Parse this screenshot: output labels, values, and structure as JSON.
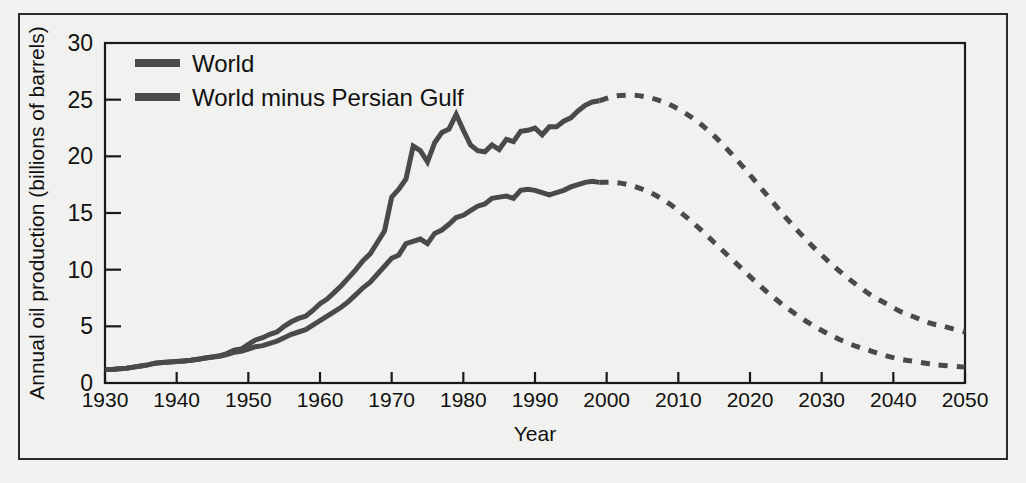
{
  "figure": {
    "background_color": "#f1f1ef",
    "frame_color": "#2b2b2b"
  },
  "chart_data": {
    "type": "line",
    "title": "",
    "subtitle": "",
    "xlabel": "Year",
    "ylabel": "Annual oil production (billions of barrels)",
    "xlim": [
      1930,
      2050
    ],
    "ylim": [
      0,
      30
    ],
    "xticks": [
      1930,
      1940,
      1950,
      1960,
      1970,
      1980,
      1990,
      2000,
      2010,
      2020,
      2030,
      2040,
      2050
    ],
    "yticks": [
      0,
      5,
      10,
      15,
      20,
      25,
      30
    ],
    "xtick_labels": [
      "1930",
      "1940",
      "1950",
      "1960",
      "1970",
      "1980",
      "1990",
      "2000",
      "2010",
      "2020",
      "2030",
      "2040",
      "2050"
    ],
    "ytick_labels": [
      "0",
      "5",
      "10",
      "15",
      "20",
      "25",
      "30"
    ],
    "grid": false,
    "legend_position": "upper-left",
    "line_color": "#4a4a4a",
    "line_width": 5,
    "projection_style": "dashed",
    "history_end_year": 1999,
    "series": [
      {
        "name": "World",
        "color": "#4a4a4a",
        "x": [
          1930,
          1931,
          1932,
          1933,
          1934,
          1935,
          1936,
          1937,
          1938,
          1939,
          1940,
          1941,
          1942,
          1943,
          1944,
          1945,
          1946,
          1947,
          1948,
          1949,
          1950,
          1951,
          1952,
          1953,
          1954,
          1955,
          1956,
          1957,
          1958,
          1959,
          1960,
          1961,
          1962,
          1963,
          1964,
          1965,
          1966,
          1967,
          1968,
          1969,
          1970,
          1971,
          1972,
          1973,
          1974,
          1975,
          1976,
          1977,
          1978,
          1979,
          1980,
          1981,
          1982,
          1983,
          1984,
          1985,
          1986,
          1987,
          1988,
          1989,
          1990,
          1991,
          1992,
          1993,
          1994,
          1995,
          1996,
          1997,
          1998,
          1999
        ],
        "values": [
          1.2,
          1.2,
          1.25,
          1.3,
          1.4,
          1.5,
          1.6,
          1.75,
          1.8,
          1.85,
          1.9,
          1.95,
          2.0,
          2.1,
          2.2,
          2.3,
          2.4,
          2.6,
          2.9,
          3.0,
          3.4,
          3.8,
          4.0,
          4.3,
          4.5,
          5.0,
          5.4,
          5.7,
          5.9,
          6.4,
          7.0,
          7.4,
          8.0,
          8.6,
          9.3,
          10.0,
          10.8,
          11.4,
          12.4,
          13.4,
          16.4,
          17.1,
          18.0,
          20.9,
          20.5,
          19.5,
          21.2,
          22.1,
          22.4,
          23.7,
          22.3,
          21.0,
          20.5,
          20.4,
          21.0,
          20.6,
          21.5,
          21.3,
          22.2,
          22.3,
          22.5,
          21.9,
          22.6,
          22.6,
          23.1,
          23.4,
          24.0,
          24.5,
          24.8,
          24.9
        ]
      },
      {
        "name": "World minus Persian Gulf",
        "color": "#4a4a4a",
        "x": [
          1930,
          1931,
          1932,
          1933,
          1934,
          1935,
          1936,
          1937,
          1938,
          1939,
          1940,
          1941,
          1942,
          1943,
          1944,
          1945,
          1946,
          1947,
          1948,
          1949,
          1950,
          1951,
          1952,
          1953,
          1954,
          1955,
          1956,
          1957,
          1958,
          1959,
          1960,
          1961,
          1962,
          1963,
          1964,
          1965,
          1966,
          1967,
          1968,
          1969,
          1970,
          1971,
          1972,
          1973,
          1974,
          1975,
          1976,
          1977,
          1978,
          1979,
          1980,
          1981,
          1982,
          1983,
          1984,
          1985,
          1986,
          1987,
          1988,
          1989,
          1990,
          1991,
          1992,
          1993,
          1994,
          1995,
          1996,
          1997,
          1998,
          1999
        ],
        "values": [
          1.2,
          1.2,
          1.25,
          1.3,
          1.4,
          1.5,
          1.6,
          1.75,
          1.8,
          1.85,
          1.9,
          1.95,
          2.0,
          2.1,
          2.2,
          2.3,
          2.35,
          2.5,
          2.7,
          2.8,
          3.0,
          3.2,
          3.3,
          3.5,
          3.7,
          4.0,
          4.3,
          4.5,
          4.7,
          5.1,
          5.5,
          5.9,
          6.3,
          6.7,
          7.2,
          7.8,
          8.4,
          8.9,
          9.6,
          10.3,
          11.0,
          11.3,
          12.3,
          12.5,
          12.7,
          12.3,
          13.2,
          13.5,
          14.0,
          14.6,
          14.8,
          15.2,
          15.6,
          15.8,
          16.3,
          16.4,
          16.5,
          16.3,
          17.0,
          17.1,
          17.0,
          16.8,
          16.6,
          16.8,
          17.0,
          17.3,
          17.5,
          17.7,
          17.8,
          17.7
        ]
      }
    ],
    "projections": [
      {
        "name": "World",
        "color": "#4a4a4a",
        "x": [
          1999,
          2001,
          2003,
          2005,
          2007,
          2009,
          2011,
          2013,
          2015,
          2017,
          2019,
          2021,
          2023,
          2025,
          2027,
          2029,
          2031,
          2033,
          2035,
          2037,
          2039,
          2041,
          2043,
          2045,
          2047,
          2050
        ],
        "values": [
          24.9,
          25.3,
          25.4,
          25.3,
          25.0,
          24.5,
          23.8,
          22.9,
          21.8,
          20.5,
          19.1,
          17.6,
          16.1,
          14.6,
          13.2,
          11.9,
          10.7,
          9.6,
          8.6,
          7.7,
          7.0,
          6.3,
          5.8,
          5.3,
          5.0,
          4.5
        ]
      },
      {
        "name": "World minus Persian Gulf",
        "color": "#4a4a4a",
        "x": [
          1999,
          2001,
          2003,
          2005,
          2007,
          2009,
          2011,
          2013,
          2015,
          2017,
          2019,
          2021,
          2023,
          2025,
          2027,
          2029,
          2031,
          2033,
          2035,
          2037,
          2039,
          2041,
          2043,
          2045,
          2047,
          2050
        ],
        "values": [
          17.7,
          17.7,
          17.5,
          17.1,
          16.5,
          15.7,
          14.7,
          13.6,
          12.4,
          11.2,
          10.0,
          8.8,
          7.7,
          6.7,
          5.8,
          5.0,
          4.3,
          3.7,
          3.2,
          2.8,
          2.4,
          2.1,
          1.9,
          1.7,
          1.55,
          1.4
        ]
      }
    ],
    "legend": [
      {
        "label": "World",
        "color": "#4a4a4a"
      },
      {
        "label": "World minus Persian Gulf",
        "color": "#4a4a4a"
      }
    ]
  }
}
